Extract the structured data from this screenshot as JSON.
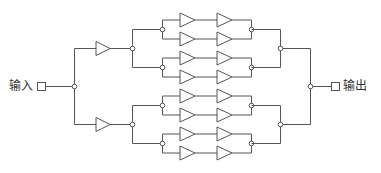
{
  "diagram": {
    "type": "redundant amplifier tree (series-parallel)",
    "input_label": "输入",
    "output_label": "输出",
    "colors": {
      "line": "#555555",
      "background": "#ffffff",
      "text": "#333333"
    },
    "structure": {
      "stage1_amplifiers": 2,
      "stage2_groups": 4,
      "amplifiers_per_group_row": 2,
      "rows": 8,
      "total_amplifiers": 18
    }
  }
}
